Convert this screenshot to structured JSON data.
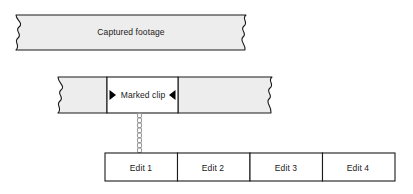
{
  "diagram": {
    "title_alt": "Video capture and edit workflow",
    "colors": {
      "strip_fill": "#ededed",
      "clip_fill": "#ffffff",
      "stroke": "#1a1a1a",
      "marker_fill": "#000000",
      "chain": "#9a9a9a",
      "edit_fill": "#ffffff",
      "background": "#ffffff"
    },
    "captured_strip": {
      "label": "Captured footage"
    },
    "clip_strip": {
      "label": "Marked clip",
      "in_marker_icon": "triangle-right-icon",
      "out_marker_icon": "triangle-left-icon"
    },
    "connector": {
      "icon": "chain-link-icon"
    },
    "edits": [
      {
        "label": "Edit 1"
      },
      {
        "label": "Edit 2"
      },
      {
        "label": "Edit 3"
      },
      {
        "label": "Edit 4"
      }
    ]
  }
}
